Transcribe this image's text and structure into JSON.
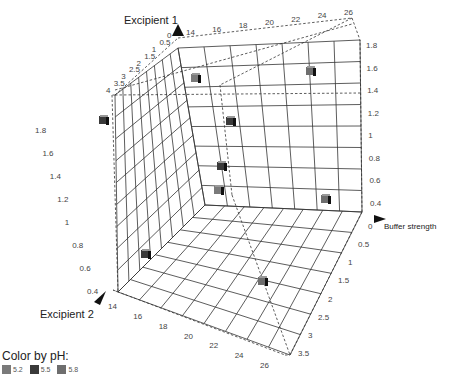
{
  "chart_data": {
    "type": "scatter",
    "subtype": "3d-scatter",
    "axes": {
      "excipient1": {
        "label": "Excipient 1",
        "ticks": [
          "4",
          "3.5",
          "3",
          "2.5",
          "2",
          "1.5",
          "1",
          "0.5",
          "0"
        ]
      },
      "buffer": {
        "label": "Buffer strength",
        "ticks_top": [
          "14",
          "16",
          "18",
          "20",
          "22",
          "24",
          "26"
        ],
        "ticks_right_vertical": [
          "1.8",
          "1.6",
          "1.4",
          "1.2",
          "1",
          "0.8",
          "0.6",
          "0.4"
        ],
        "ticks_depth": [
          "0",
          "0.5",
          "1",
          "1.5",
          "2",
          "2.5",
          "3",
          "3.5"
        ]
      },
      "excipient2": {
        "label": "Excipient 2",
        "ticks_bottom": [
          "14",
          "16",
          "18",
          "20",
          "22",
          "24",
          "26"
        ],
        "ticks_left_vertical": [
          "1.8",
          "1.6",
          "1.4",
          "1.2",
          "1",
          "0.8",
          "0.6",
          "0.4"
        ]
      }
    },
    "legend": {
      "title": "Color by pH:",
      "entries": [
        {
          "label": "5.2",
          "color": "#7a7a7a"
        },
        {
          "label": "5.5",
          "color": "#3a3a3a"
        },
        {
          "label": "5.8",
          "color": "#6e6e6e"
        }
      ]
    },
    "points": [
      {
        "x": 103,
        "y": 120,
        "ph": "5.5"
      },
      {
        "x": 195,
        "y": 78,
        "ph": "5.2"
      },
      {
        "x": 310,
        "y": 71,
        "ph": "5.8"
      },
      {
        "x": 230,
        "y": 121,
        "ph": "5.5"
      },
      {
        "x": 221,
        "y": 166,
        "ph": "5.5"
      },
      {
        "x": 218,
        "y": 190,
        "ph": "5.2"
      },
      {
        "x": 325,
        "y": 199,
        "ph": "5.8"
      },
      {
        "x": 145,
        "y": 254,
        "ph": "5.5"
      },
      {
        "x": 262,
        "y": 281,
        "ph": "5.8"
      }
    ]
  }
}
